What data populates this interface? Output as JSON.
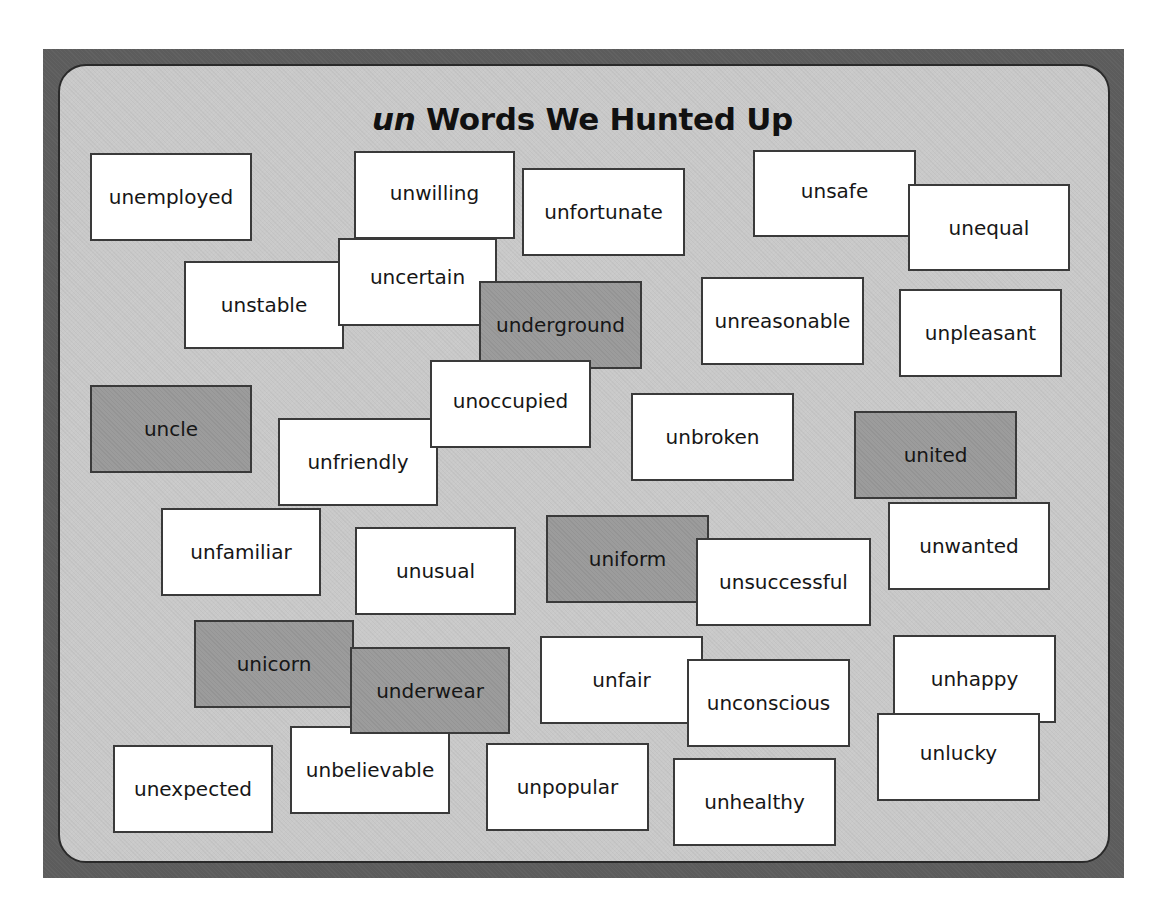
{
  "board": {
    "title_prefix": "un",
    "title_rest": " Words We Hunted Up",
    "colors": {
      "frame": "#5c5c5c",
      "panel": "#c9c9c9",
      "card": "#ffffff",
      "card_shaded": "#9c9c9c",
      "border": "#3a3a3a"
    }
  },
  "cards": [
    {
      "word": "unemployed",
      "shaded": false
    },
    {
      "word": "unwilling",
      "shaded": false
    },
    {
      "word": "unfortunate",
      "shaded": false
    },
    {
      "word": "unsafe",
      "shaded": false
    },
    {
      "word": "unequal",
      "shaded": false
    },
    {
      "word": "unstable",
      "shaded": false
    },
    {
      "word": "uncertain",
      "shaded": false
    },
    {
      "word": "underground",
      "shaded": true
    },
    {
      "word": "unreasonable",
      "shaded": false
    },
    {
      "word": "unpleasant",
      "shaded": false
    },
    {
      "word": "uncle",
      "shaded": true
    },
    {
      "word": "unoccupied",
      "shaded": false
    },
    {
      "word": "unfriendly",
      "shaded": false
    },
    {
      "word": "unbroken",
      "shaded": false
    },
    {
      "word": "united",
      "shaded": true
    },
    {
      "word": "unfamiliar",
      "shaded": false
    },
    {
      "word": "unusual",
      "shaded": false
    },
    {
      "word": "uniform",
      "shaded": true
    },
    {
      "word": "unsuccessful",
      "shaded": false
    },
    {
      "word": "unwanted",
      "shaded": false
    },
    {
      "word": "unicorn",
      "shaded": true
    },
    {
      "word": "underwear",
      "shaded": true
    },
    {
      "word": "unfair",
      "shaded": false
    },
    {
      "word": "unconscious",
      "shaded": false
    },
    {
      "word": "unhappy",
      "shaded": false
    },
    {
      "word": "unlucky",
      "shaded": false
    },
    {
      "word": "unexpected",
      "shaded": false
    },
    {
      "word": "unbelievable",
      "shaded": false
    },
    {
      "word": "unpopular",
      "shaded": false
    },
    {
      "word": "unhealthy",
      "shaded": false
    }
  ]
}
